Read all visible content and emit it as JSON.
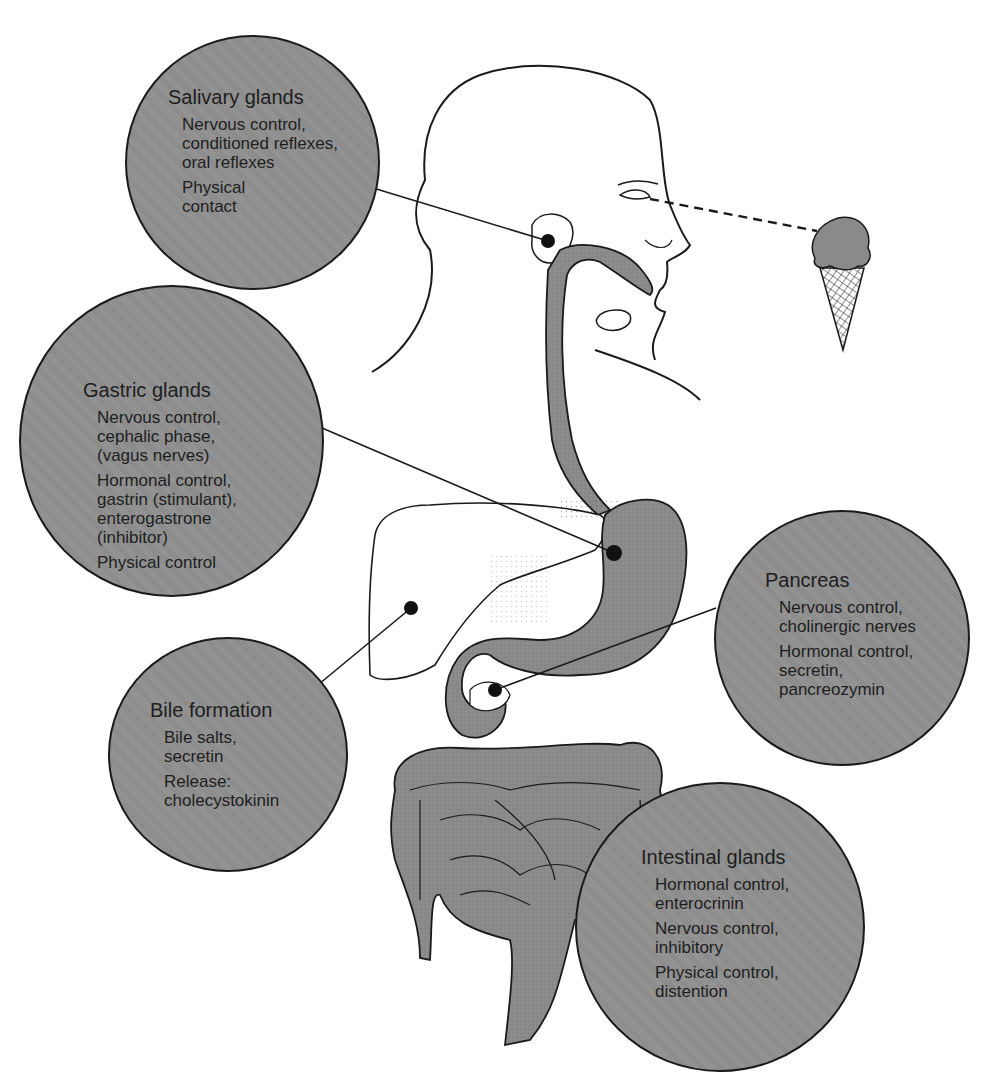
{
  "diagram": {
    "stimulus_icon": "ice-cream-cone-icon",
    "labels": {
      "salivary": {
        "title": "Salivary glands",
        "groups": [
          [
            "Nervous control,",
            "conditioned reflexes,",
            "oral reflexes"
          ],
          [
            "Physical",
            "contact"
          ]
        ]
      },
      "gastric": {
        "title": "Gastric glands",
        "groups": [
          [
            "Nervous control,",
            "cephalic phase,",
            "(vagus nerves)"
          ],
          [
            "Hormonal control,",
            "gastrin (stimulant),",
            "enterogastrone",
            "(inhibitor)"
          ],
          [
            "Physical control"
          ]
        ]
      },
      "pancreas": {
        "title": "Pancreas",
        "groups": [
          [
            "Nervous control,",
            "cholinergic nerves"
          ],
          [
            "Hormonal control,",
            "secretin,",
            "pancreozymin"
          ]
        ]
      },
      "bile": {
        "title": "Bile formation",
        "groups": [
          [
            "Bile salts,",
            "secretin"
          ],
          [
            "Release:",
            "cholecystokinin"
          ]
        ]
      },
      "intestinal": {
        "title": "Intestinal glands",
        "groups": [
          [
            "Hormonal control,",
            "enterocrinin"
          ],
          [
            "Nervous control,",
            "inhibitory"
          ],
          [
            "Physical control,",
            "distention"
          ]
        ]
      }
    },
    "colors": {
      "circle_fill": "#8f8f8f",
      "organ_fill": "#8a8a8a",
      "outline": "#1a1a1a",
      "background": "#ffffff"
    }
  }
}
